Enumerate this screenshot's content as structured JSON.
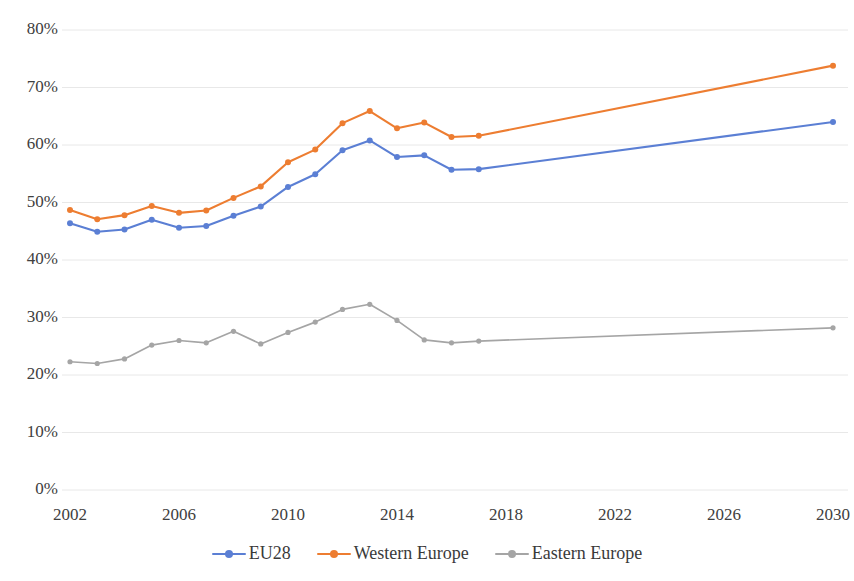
{
  "chart_data": {
    "type": "line",
    "title": "",
    "subtitle": "",
    "xlabel": "",
    "ylabel": "",
    "grid": true,
    "legend_position": "bottom",
    "x": [
      2002,
      2003,
      2004,
      2005,
      2006,
      2007,
      2008,
      2009,
      2010,
      2011,
      2012,
      2013,
      2014,
      2015,
      2016,
      2017,
      2030
    ],
    "x_tick_labels": [
      "2002",
      "2006",
      "2010",
      "2014",
      "2018",
      "2022",
      "2026",
      "2030"
    ],
    "x_ticks": [
      2002,
      2006,
      2010,
      2014,
      2018,
      2022,
      2026,
      2030
    ],
    "xlim": [
      2002,
      2030
    ],
    "y_tick_labels": [
      "0%",
      "10%",
      "20%",
      "30%",
      "40%",
      "50%",
      "60%",
      "70%",
      "80%"
    ],
    "y_ticks": [
      0,
      10,
      20,
      30,
      40,
      50,
      60,
      70,
      80
    ],
    "ylim": [
      0,
      80
    ],
    "y_unit": "%",
    "series": [
      {
        "name": "EU28",
        "color": "#5B7FD4",
        "values": [
          46.4,
          44.9,
          45.3,
          47.0,
          45.6,
          45.9,
          47.7,
          49.3,
          52.7,
          54.9,
          59.1,
          60.8,
          57.9,
          58.2,
          55.7,
          55.8,
          64.0
        ]
      },
      {
        "name": "Western Europe",
        "color": "#ED7D31",
        "values": [
          48.7,
          47.1,
          47.8,
          49.4,
          48.2,
          48.6,
          50.8,
          52.8,
          57.0,
          59.2,
          63.8,
          65.9,
          62.9,
          63.9,
          61.4,
          61.6,
          73.8
        ]
      },
      {
        "name": "Eastern Europe",
        "color": "#A5A5A5",
        "values": [
          22.3,
          22.0,
          22.8,
          25.2,
          26.0,
          25.6,
          27.6,
          25.4,
          27.4,
          29.2,
          31.4,
          32.3,
          29.5,
          26.1,
          25.6,
          25.9,
          28.2
        ]
      }
    ]
  },
  "legend": {
    "items": [
      {
        "label": "EU28",
        "color": "#5B7FD4"
      },
      {
        "label": "Western Europe",
        "color": "#ED7D31"
      },
      {
        "label": "Eastern Europe",
        "color": "#A5A5A5"
      }
    ]
  },
  "colors": {
    "eu28": "#5B7FD4",
    "western_europe": "#ED7D31",
    "eastern_europe": "#A5A5A5",
    "gridline": "#E8E8E8",
    "text": "#404040",
    "background": "#FFFFFF"
  }
}
